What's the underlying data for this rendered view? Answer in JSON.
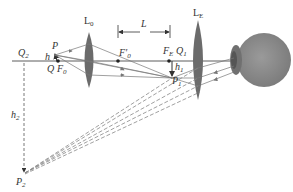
{
  "diagram": {
    "colors": {
      "lens": "#6b6b6b",
      "eye": "#8a8a8a",
      "axis": "#333333",
      "ray": "#777777",
      "virtual_ray": "#888888"
    },
    "labels": {
      "L0": "L",
      "L0_sub": "0",
      "LE": "L",
      "LE_sub": "E",
      "L": "L",
      "Q2": "Q",
      "Q2_sub": "2",
      "P": "P",
      "h": "h",
      "Q": "Q",
      "F0": "F",
      "F0_sub": "0",
      "F0prime": "F′",
      "F0prime_sub": "0",
      "FE": "F",
      "FE_sub": "E",
      "Q1": "Q",
      "Q1_sub": "1",
      "h1": "h",
      "h1_sub": "1",
      "P1": "P",
      "P1_sub": "1",
      "h2": "h",
      "h2_sub": "2",
      "P2": "P",
      "P2_sub": "2"
    }
  }
}
